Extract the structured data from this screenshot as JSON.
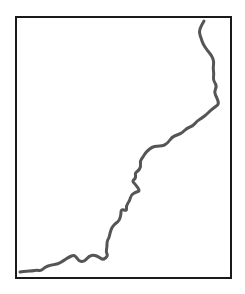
{
  "diagram": {
    "type": "line-trace",
    "stroke_color": "#555555",
    "frame_color": "#1a1a1a",
    "path_points": [
      [
        204,
        21
      ],
      [
        201,
        26
      ],
      [
        199,
        32
      ],
      [
        201,
        38
      ],
      [
        203,
        44
      ],
      [
        207,
        50
      ],
      [
        212,
        56
      ],
      [
        214,
        62
      ],
      [
        213,
        68
      ],
      [
        214,
        74
      ],
      [
        213,
        80
      ],
      [
        217,
        86
      ],
      [
        214,
        92
      ],
      [
        217,
        98
      ],
      [
        219,
        104
      ],
      [
        215,
        107
      ],
      [
        211,
        110
      ],
      [
        207,
        114
      ],
      [
        202,
        118
      ],
      [
        197,
        121
      ],
      [
        193,
        126
      ],
      [
        187,
        128
      ],
      [
        182,
        133
      ],
      [
        177,
        135
      ],
      [
        172,
        137
      ],
      [
        167,
        144
      ],
      [
        162,
        146
      ],
      [
        157,
        146
      ],
      [
        152,
        147
      ],
      [
        146,
        152
      ],
      [
        143,
        157
      ],
      [
        140,
        161
      ],
      [
        141,
        167
      ],
      [
        138,
        171
      ],
      [
        135,
        173
      ],
      [
        136,
        178
      ],
      [
        132,
        181
      ],
      [
        136,
        185
      ],
      [
        140,
        191
      ],
      [
        136,
        192
      ],
      [
        131,
        195
      ],
      [
        130,
        200
      ],
      [
        126,
        206
      ],
      [
        127,
        211
      ],
      [
        121,
        209
      ],
      [
        121,
        215
      ],
      [
        119,
        221
      ],
      [
        116,
        223
      ],
      [
        112,
        227
      ],
      [
        110,
        233
      ],
      [
        109,
        238
      ],
      [
        107,
        241
      ],
      [
        107,
        247
      ],
      [
        106,
        252
      ],
      [
        108,
        256
      ],
      [
        103,
        260
      ],
      [
        99,
        257
      ],
      [
        94,
        255
      ],
      [
        89,
        256
      ],
      [
        84,
        262
      ],
      [
        79,
        261
      ],
      [
        77,
        258
      ],
      [
        74,
        255
      ],
      [
        69,
        257
      ],
      [
        63,
        261
      ],
      [
        58,
        264
      ],
      [
        51,
        265
      ],
      [
        45,
        267
      ],
      [
        41,
        271
      ],
      [
        37,
        270
      ],
      [
        32,
        271
      ],
      [
        27,
        271
      ],
      [
        20,
        272
      ]
    ]
  }
}
